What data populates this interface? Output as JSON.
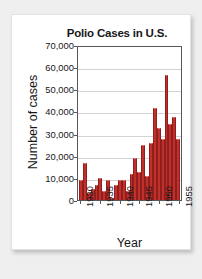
{
  "chart_data": {
    "type": "bar",
    "title": "Polio Cases in U.S.",
    "xlabel": "Year",
    "ylabel": "Number of cases",
    "ylim": [
      0,
      70000
    ],
    "ytick_labels": [
      "70,000",
      "60,000",
      "50,000",
      "40,000",
      "30,000",
      "20,000",
      "10,000",
      "0"
    ],
    "ytick_values": [
      70000,
      60000,
      50000,
      40000,
      30000,
      20000,
      10000,
      0
    ],
    "xtick_labels": [
      "1930",
      "1935",
      "1940",
      "1945",
      "1950",
      "1955"
    ],
    "xtick_values": [
      1930,
      1935,
      1940,
      1945,
      1950,
      1955
    ],
    "grid": true,
    "legend": "none",
    "bar_color": "#c2302c",
    "categories": [
      1930,
      1931,
      1932,
      1933,
      1934,
      1935,
      1936,
      1937,
      1938,
      1939,
      1940,
      1941,
      1942,
      1943,
      1944,
      1945,
      1946,
      1947,
      1948,
      1949,
      1950,
      1951,
      1952,
      1953,
      1954,
      1955
    ],
    "values": [
      9000,
      17000,
      3000,
      5000,
      7000,
      10000,
      4000,
      9000,
      1000,
      7000,
      9000,
      9000,
      4000,
      12000,
      19000,
      13000,
      25000,
      11000,
      26000,
      42000,
      33000,
      28000,
      57000,
      35000,
      38000,
      28000
    ]
  },
  "chart": {
    "title": "Polio Cases in U.S.",
    "x_axis_title": "Year",
    "y_axis_title": "Number of cases"
  }
}
